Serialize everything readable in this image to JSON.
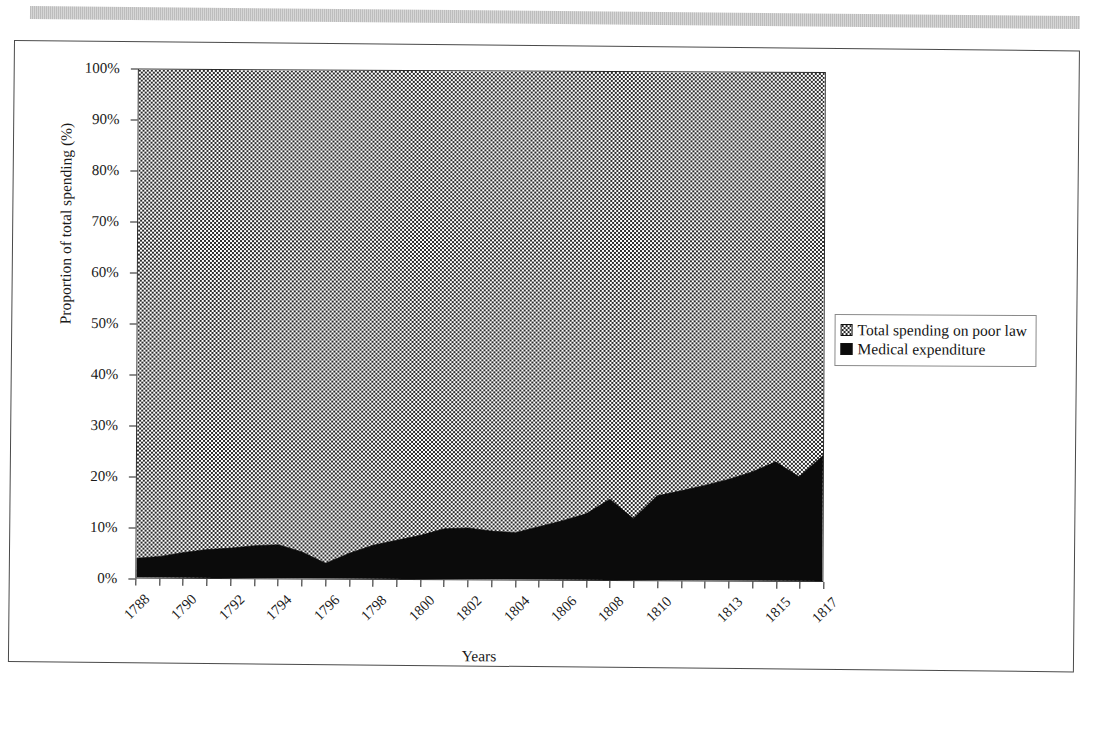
{
  "page": {
    "background_color": "#ffffff",
    "frame_border_color": "#4a4a4a",
    "scan_artifact": "gray-stripe-bar"
  },
  "legend": {
    "position": "right-middle",
    "items": [
      {
        "label": "Total spending on poor law",
        "swatch": "dotted-stipple",
        "color": "#ffffff"
      },
      {
        "label": "Medical expenditure",
        "swatch": "solid-black",
        "color": "#0b0b0b"
      }
    ]
  },
  "axes": {
    "y_title": "Proportion of total spending (%)",
    "x_title": "Years",
    "y_ticks": [
      "0%",
      "10%",
      "20%",
      "30%",
      "40%",
      "50%",
      "60%",
      "70%",
      "80%",
      "90%",
      "100%"
    ],
    "x_tick_labels": [
      "1788",
      "1790",
      "1792",
      "1794",
      "1796",
      "1798",
      "1800",
      "1802",
      "1804",
      "1806",
      "1808",
      "1810",
      "1813",
      "1815",
      "1817"
    ]
  },
  "chart_data": {
    "type": "area",
    "title": "",
    "subtitle": "",
    "xlabel": "Years",
    "ylabel": "Proportion of total spending (%)",
    "ylim": [
      0,
      100
    ],
    "ytick_values": [
      0,
      10,
      20,
      30,
      40,
      50,
      60,
      70,
      80,
      90,
      100
    ],
    "ytick_labels": [
      "0%",
      "10%",
      "20%",
      "30%",
      "40%",
      "50%",
      "60%",
      "70%",
      "80%",
      "90%",
      "100%"
    ],
    "grid": false,
    "stacked": true,
    "legend_position": "right",
    "x": [
      "1788",
      "1789",
      "1790",
      "1791",
      "1792",
      "1793",
      "1794",
      "1795",
      "1796",
      "1797",
      "1798",
      "1799",
      "1800",
      "1801",
      "1802",
      "1803",
      "1804",
      "1805",
      "1806",
      "1807",
      "1808",
      "1809",
      "1810",
      "1811",
      "1812",
      "1813",
      "1814",
      "1815",
      "1816",
      "1817"
    ],
    "x_labeled": [
      "1788",
      "",
      "1790",
      "",
      "1792",
      "",
      "1794",
      "",
      "1796",
      "",
      "1798",
      "",
      "1800",
      "",
      "1802",
      "",
      "1804",
      "",
      "1806",
      "",
      "1808",
      "",
      "1810",
      "",
      "",
      "1813",
      "",
      "1815",
      "",
      "1817"
    ],
    "series": [
      {
        "name": "Medical expenditure",
        "fill": "solid-black",
        "color": "#0b0b0b",
        "values": [
          3.8,
          4.2,
          5.0,
          5.6,
          5.9,
          6.4,
          6.6,
          5.2,
          3.0,
          5.0,
          6.6,
          7.6,
          8.6,
          9.9,
          10.1,
          9.5,
          9.2,
          10.4,
          11.6,
          13.0,
          15.9,
          12.1,
          16.6,
          17.6,
          18.7,
          19.9,
          21.4,
          23.4,
          20.5,
          24.7
        ]
      },
      {
        "name": "Total spending on poor law",
        "fill": "dotted-stipple",
        "color": "#ffffff",
        "values": [
          96.2,
          95.8,
          95.0,
          94.4,
          94.1,
          93.6,
          93.4,
          94.8,
          97.0,
          95.0,
          93.4,
          92.4,
          91.4,
          90.1,
          89.9,
          90.5,
          90.8,
          89.6,
          88.4,
          87.0,
          84.1,
          87.9,
          83.4,
          82.4,
          81.3,
          80.1,
          78.6,
          76.6,
          79.5,
          75.3
        ]
      }
    ]
  }
}
